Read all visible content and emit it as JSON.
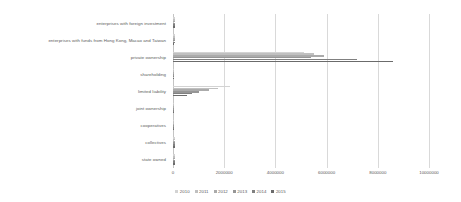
{
  "chart_data": {
    "type": "bar",
    "orientation": "horizontal",
    "title": "",
    "xlabel": "",
    "ylabel": "",
    "xlim": [
      0,
      10000000
    ],
    "xticks": [
      "0",
      "2000000",
      "4000000",
      "6000000",
      "8000000",
      "10000000"
    ],
    "xtick_values": [
      0,
      2000000,
      4000000,
      6000000,
      8000000,
      10000000
    ],
    "grid": true,
    "legend_position": "bottom",
    "categories": [
      "enterprises with foreign investment",
      "enterprises with funds from Hong Kong, Macao and Taiwan",
      "private ownership",
      "shareholding",
      "limited liability",
      "joint ownership",
      "cooperatives",
      "collectives",
      "state owned"
    ],
    "series": [
      {
        "name": "2010",
        "color": "#d3d3d3",
        "values": [
          72000,
          68000,
          5100000,
          45000,
          2230000,
          9000,
          52000,
          96000,
          85000
        ]
      },
      {
        "name": "2011",
        "color": "#c0c0c0",
        "values": [
          70000,
          66000,
          5500000,
          43000,
          1760000,
          8000,
          44000,
          88000,
          80000
        ]
      },
      {
        "name": "2012",
        "color": "#ababab",
        "values": [
          68000,
          64000,
          5900000,
          41000,
          1390000,
          7000,
          38000,
          80000,
          76000
        ]
      },
      {
        "name": "2013",
        "color": "#969696",
        "values": [
          66000,
          62000,
          5400000,
          39000,
          1030000,
          6000,
          33000,
          73000,
          72000
        ]
      },
      {
        "name": "2014",
        "color": "#808080",
        "values": [
          64000,
          60000,
          7200000,
          37000,
          760000,
          5000,
          28000,
          66000,
          68000
        ]
      },
      {
        "name": "2015",
        "color": "#6b6b6b",
        "values": [
          62000,
          58000,
          8600000,
          35000,
          560000,
          4000,
          24000,
          60000,
          64000
        ]
      }
    ]
  }
}
